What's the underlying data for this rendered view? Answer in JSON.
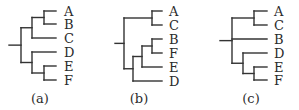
{
  "figure": {
    "line_color": "#333333",
    "text_color": "#2b2b2b",
    "panels": [
      {
        "id": "a",
        "caption": "(a)",
        "newick": "(((A,B),C),(D,(E,F)))",
        "leaf_order": [
          "A",
          "B",
          "C",
          "D",
          "E",
          "F"
        ],
        "tree": {
          "children": [
            {
              "children": [
                {
                  "children": [
                    {
                      "leaf": "A"
                    },
                    {
                      "leaf": "B"
                    }
                  ]
                },
                {
                  "leaf": "C"
                }
              ]
            },
            {
              "children": [
                {
                  "leaf": "D"
                },
                {
                  "children": [
                    {
                      "leaf": "E"
                    },
                    {
                      "leaf": "F"
                    }
                  ]
                }
              ]
            }
          ]
        }
      },
      {
        "id": "b",
        "caption": "(b)",
        "newick": "((A,C),(((B,F),E),D))",
        "leaf_order": [
          "A",
          "C",
          "B",
          "F",
          "E",
          "D"
        ],
        "tree": {
          "children": [
            {
              "children": [
                {
                  "leaf": "A"
                },
                {
                  "leaf": "C"
                }
              ]
            },
            {
              "children": [
                {
                  "children": [
                    {
                      "children": [
                        {
                          "leaf": "B"
                        },
                        {
                          "leaf": "F"
                        }
                      ]
                    },
                    {
                      "leaf": "E"
                    }
                  ]
                },
                {
                  "leaf": "D"
                }
              ]
            }
          ]
        }
      },
      {
        "id": "c",
        "caption": "(c)",
        "newick": "((A,C),B,(D,(E,F)))",
        "leaf_order": [
          "A",
          "C",
          "B",
          "D",
          "E",
          "F"
        ],
        "tree": {
          "children": [
            {
              "children": [
                {
                  "leaf": "A"
                },
                {
                  "leaf": "C"
                }
              ]
            },
            {
              "leaf": "B"
            },
            {
              "children": [
                {
                  "leaf": "D"
                },
                {
                  "children": [
                    {
                      "leaf": "E"
                    },
                    {
                      "leaf": "F"
                    }
                  ]
                }
              ]
            }
          ]
        }
      }
    ]
  }
}
